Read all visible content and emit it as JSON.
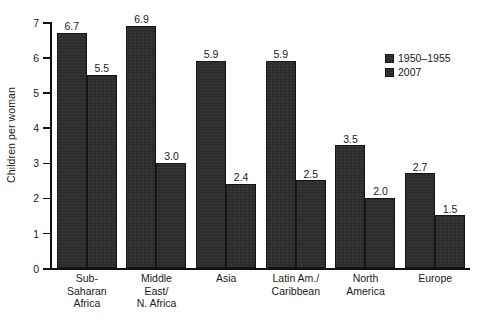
{
  "chart_data": {
    "type": "bar",
    "title": "",
    "xlabel": "",
    "ylabel": "Children per woman",
    "ylim": [
      0,
      7
    ],
    "ytick_labels": [
      "0",
      "1",
      "2",
      "3",
      "4",
      "5",
      "6",
      "7"
    ],
    "grid": false,
    "legend_position": "upper-right",
    "categories": [
      "Sub-\nSaharan\nAfrica",
      "Middle\nEast/\nN. Africa",
      "Asia",
      "Latin Am./\nCaribbean",
      "North\nAmerica",
      "Europe"
    ],
    "category_lines": [
      [
        "Sub-",
        "Saharan",
        "Africa"
      ],
      [
        "Middle",
        "East/",
        "N. Africa"
      ],
      [
        "Asia"
      ],
      [
        "Latin Am./",
        "Caribbean"
      ],
      [
        "North",
        "America"
      ],
      [
        "Europe"
      ]
    ],
    "series": [
      {
        "name": "1950–1955",
        "color": "#2b2b2b",
        "values": [
          6.7,
          6.9,
          5.9,
          5.9,
          3.5,
          2.7
        ],
        "labels": [
          "6.7",
          "6.9",
          "5.9",
          "5.9",
          "3.5",
          "2.7"
        ]
      },
      {
        "name": "2007",
        "color": "#2b2b2b",
        "values": [
          5.5,
          3.0,
          2.4,
          2.5,
          2.0,
          1.5
        ],
        "labels": [
          "5.5",
          "3.0",
          "2.4",
          "2.5",
          "2.0",
          "1.5"
        ]
      }
    ]
  },
  "legend": {
    "items": [
      {
        "label": "1950–1955"
      },
      {
        "label": "2007"
      }
    ]
  },
  "axes": {
    "y_title": "Children per woman"
  }
}
